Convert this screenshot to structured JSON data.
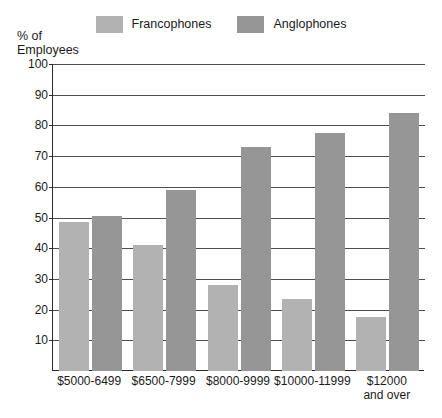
{
  "chart_data": {
    "type": "bar",
    "title": "",
    "subtitle": "",
    "xlabel": "",
    "ylabel": "% of\nEmployees",
    "ylim": [
      0,
      100
    ],
    "yticks": [
      10,
      20,
      30,
      40,
      50,
      60,
      70,
      80,
      90,
      100
    ],
    "grid": true,
    "legend_position": "top-center",
    "categories": [
      "$5000-6499",
      "$6500-7999",
      "$8000-9999",
      "$10000-11999",
      "$12000\nand over"
    ],
    "series": [
      {
        "name": "Francophones",
        "color": "#b2b2b2",
        "values": [
          48.5,
          41,
          28,
          23.5,
          17.5
        ]
      },
      {
        "name": "Anglophones",
        "color": "#969696",
        "values": [
          50.5,
          59,
          73,
          77.5,
          84
        ]
      }
    ]
  },
  "legend": {
    "entries": [
      {
        "label": "Francophones",
        "color": "#b2b2b2"
      },
      {
        "label": "Anglophones",
        "color": "#969696"
      }
    ]
  },
  "axes": {
    "y_title": "% of\nEmployees",
    "tick_labels": [
      "100",
      "90",
      "80",
      "70",
      "60",
      "50",
      "40",
      "30",
      "20",
      "10"
    ],
    "axis_color": "#2b2b2b",
    "gridline_color": "#4d4d4d"
  }
}
